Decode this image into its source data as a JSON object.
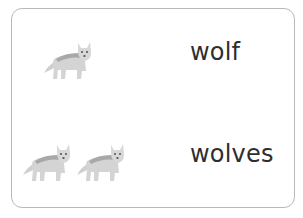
{
  "card": {
    "rows": [
      {
        "count": 1,
        "word": "wolf",
        "icon": "wolf-icon"
      },
      {
        "count": 2,
        "word": "wolves",
        "icon": "wolf-icon"
      }
    ]
  },
  "colors": {
    "border": "#b9b9b9",
    "text": "#2e2e2e",
    "wolf_body": "#d3d3d3",
    "wolf_back": "#a9a9a9"
  }
}
